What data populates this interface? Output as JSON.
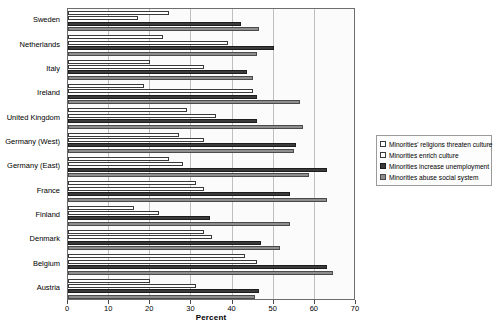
{
  "chart_data": {
    "type": "bar",
    "orientation": "horizontal",
    "title": "",
    "xlabel": "Percent",
    "ylabel": "",
    "xlim": [
      0,
      70
    ],
    "xticks": [
      0,
      10,
      20,
      30,
      40,
      50,
      60,
      70
    ],
    "grid": true,
    "legend_position": "right",
    "categories": [
      "Sweden",
      "Netherlands",
      "Italy",
      "Ireland",
      "United Kingdom",
      "Germany (West)",
      "Germany (East)",
      "France",
      "Finland",
      "Denmark",
      "Belgium",
      "Austria"
    ],
    "series": [
      {
        "name": "Minorities' religions threaten culture",
        "color": "#ffffff",
        "values": [
          24.5,
          23.0,
          20.0,
          18.5,
          29.0,
          27.0,
          24.5,
          31.0,
          16.0,
          33.0,
          43.0,
          20.0
        ]
      },
      {
        "name": "Minorities enrich culture",
        "color": "#ffffff",
        "values": [
          17.0,
          39.0,
          33.0,
          45.0,
          36.0,
          33.0,
          28.0,
          33.0,
          22.0,
          35.0,
          46.0,
          31.0
        ]
      },
      {
        "name": "Minorities increase unemployment",
        "color": "#3b3b3b",
        "values": [
          42.0,
          50.0,
          43.5,
          46.0,
          46.0,
          55.5,
          63.0,
          54.0,
          34.5,
          47.0,
          63.0,
          46.5
        ]
      },
      {
        "name": "Minorities abuse social system",
        "color": "#8e8e8e",
        "values": [
          46.5,
          46.0,
          45.0,
          56.5,
          57.0,
          55.0,
          58.5,
          63.0,
          54.0,
          51.5,
          64.5,
          45.5
        ]
      }
    ]
  }
}
